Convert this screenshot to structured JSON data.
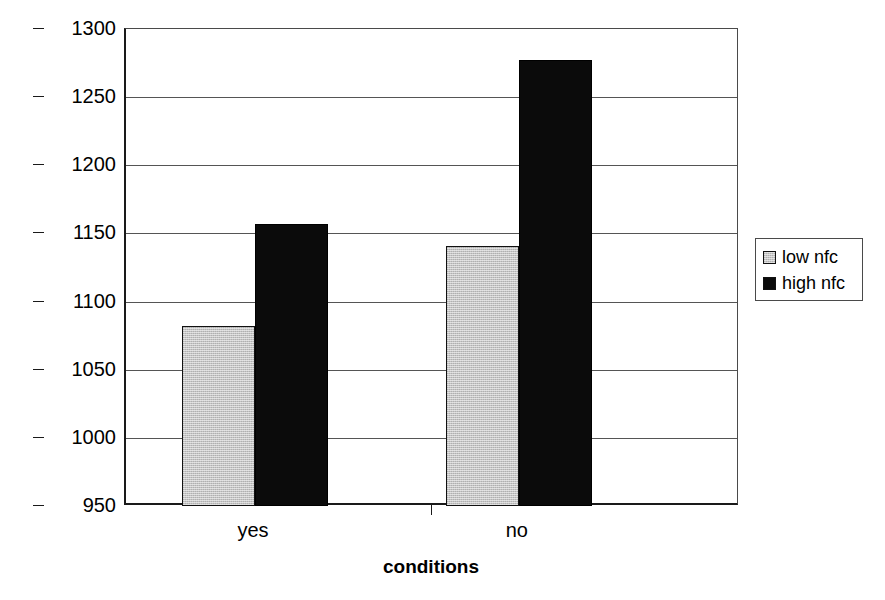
{
  "chart_data": {
    "type": "bar",
    "title": "",
    "xlabel": "conditions",
    "ylabel": "RT (msc.)",
    "categories": [
      "yes",
      "no"
    ],
    "series": [
      {
        "name": "low nfc",
        "color": "#c4c4c4",
        "values": [
          1082,
          1141
        ]
      },
      {
        "name": "high nfc",
        "color": "#000000",
        "values": [
          1157,
          1277
        ]
      }
    ],
    "ylim": [
      950,
      1300
    ],
    "yticks": [
      950,
      1000,
      1050,
      1100,
      1150,
      1200,
      1250,
      1300
    ],
    "ytick_labels": [
      "950",
      "1000",
      "1050",
      "1100",
      "1150",
      "1200",
      "1250",
      "1300"
    ],
    "grid": true,
    "legend_position": "right",
    "legend_entries": [
      "low nfc",
      "high nfc"
    ]
  },
  "axes": {
    "y_title": "RT (msc.)",
    "x_title": "conditions"
  },
  "legend": {
    "items": [
      {
        "label": "low nfc"
      },
      {
        "label": "high nfc"
      }
    ]
  }
}
